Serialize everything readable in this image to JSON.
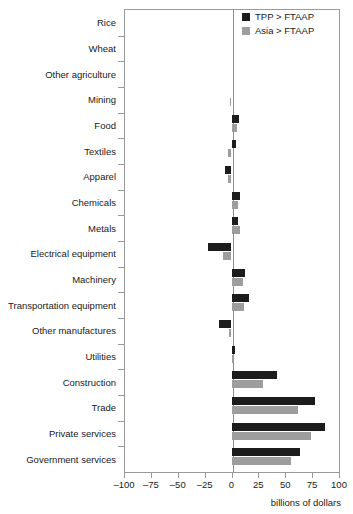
{
  "chart_data": {
    "type": "bar",
    "orientation": "horizontal",
    "title": "",
    "subtitle": "",
    "xlabel": "billions of dollars",
    "ylabel": "",
    "xlim": [
      -100,
      100
    ],
    "xticks": [
      -100,
      -75,
      -50,
      -25,
      0,
      25,
      50,
      75,
      100
    ],
    "xticklabels": [
      "–100",
      "–75",
      "–50",
      "–25",
      "0",
      "25",
      "50",
      "75",
      "100"
    ],
    "grid": false,
    "legend_position": "top-right",
    "categories": [
      "Rice",
      "Wheat",
      "Other agriculture",
      "Mining",
      "Food",
      "Textiles",
      "Apparel",
      "Chemicals",
      "Metals",
      "Electrical equipment",
      "Machinery",
      "Transportation equipment",
      "Other manufactures",
      "Utilities",
      "Construction",
      "Trade",
      "Private services",
      "Government services"
    ],
    "series": [
      {
        "name": "TPP > FTAAP",
        "color": "#1c1c1c",
        "values": [
          0,
          0,
          0,
          0,
          7,
          4,
          -6,
          8,
          6,
          -22,
          13,
          16,
          -12,
          3,
          42,
          78,
          87,
          64
        ]
      },
      {
        "name": "Asia > FTAAP",
        "color": "#9d9d9d",
        "values": [
          0,
          0,
          0,
          -1,
          5,
          -3,
          -3,
          6,
          8,
          -8,
          11,
          12,
          -2,
          2,
          29,
          62,
          74,
          55
        ]
      }
    ]
  },
  "legend": {
    "items": [
      {
        "label": "TPP > FTAAP",
        "color": "#1c1c1c"
      },
      {
        "label": "Asia > FTAAP",
        "color": "#9d9d9d"
      }
    ]
  },
  "axis": {
    "x_title": "billions of dollars"
  }
}
